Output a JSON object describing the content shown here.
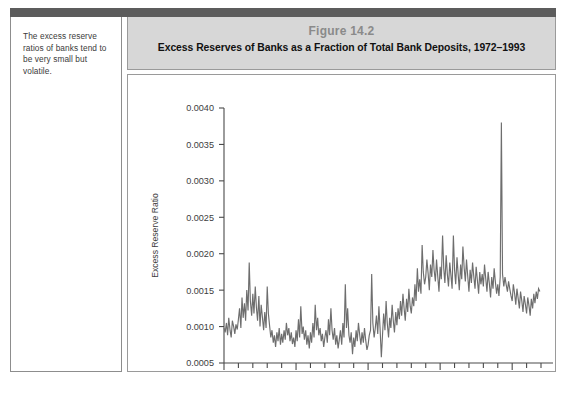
{
  "margin_note": {
    "text": "The excess reserve ratios of banks tend to be very small but volatile."
  },
  "figure": {
    "number_label": "Figure 14.2",
    "title": "Excess Reserves of Banks as a Fraction of Total Bank Deposits, 1972–1993"
  },
  "colors": {
    "caption_background": "#d7d7d7",
    "figure_number_text": "#8a8a8a",
    "title_text": "#111111",
    "top_rule": "#5c5c5c",
    "series_line": "#6e6e6e",
    "axis": "#4a4a4a",
    "panel_border": "#9a9a9a"
  },
  "chart_data": {
    "type": "line",
    "title": "Excess Reserves of Banks as a Fraction of Total Bank Deposits, 1972–1993",
    "xlabel": "",
    "ylabel": "Excess Reserve Ratio",
    "xlim": [
      1972.0,
      1994.0
    ],
    "ylim": [
      0.0005,
      0.004
    ],
    "grid": false,
    "legend": null,
    "ytick_labels": [
      "0.0005",
      "0.0010",
      "0.0015",
      "0.0020",
      "0.0025",
      "0.0030",
      "0.0035",
      "0.0040"
    ],
    "ytick_values": [
      0.0005,
      0.001,
      0.0015,
      0.002,
      0.0025,
      0.003,
      0.0035,
      0.004
    ],
    "xtick_labels": [
      "'72",
      "'77",
      "'82",
      "'87",
      "'92"
    ],
    "xtick_values": [
      1972,
      1977,
      1982,
      1987,
      1992
    ],
    "xtick_minor_step": 1,
    "series": [
      {
        "name": "Excess Reserve Ratio",
        "x": [
          1972.0,
          1972.08,
          1972.17,
          1972.25,
          1972.33,
          1972.42,
          1972.5,
          1972.58,
          1972.67,
          1972.75,
          1972.83,
          1972.92,
          1973.0,
          1973.08,
          1973.17,
          1973.25,
          1973.33,
          1973.42,
          1973.5,
          1973.58,
          1973.67,
          1973.75,
          1973.83,
          1973.92,
          1974.0,
          1974.08,
          1974.17,
          1974.25,
          1974.33,
          1974.42,
          1974.5,
          1974.58,
          1974.67,
          1974.75,
          1974.83,
          1974.92,
          1975.0,
          1975.08,
          1975.17,
          1975.25,
          1975.33,
          1975.42,
          1975.5,
          1975.58,
          1975.67,
          1975.75,
          1975.83,
          1975.92,
          1976.0,
          1976.08,
          1976.17,
          1976.25,
          1976.33,
          1976.42,
          1976.5,
          1976.58,
          1976.67,
          1976.75,
          1976.83,
          1976.92,
          1977.0,
          1977.08,
          1977.17,
          1977.25,
          1977.33,
          1977.42,
          1977.5,
          1977.58,
          1977.67,
          1977.75,
          1977.83,
          1977.92,
          1978.0,
          1978.08,
          1978.17,
          1978.25,
          1978.33,
          1978.42,
          1978.5,
          1978.58,
          1978.67,
          1978.75,
          1978.83,
          1978.92,
          1979.0,
          1979.08,
          1979.17,
          1979.25,
          1979.33,
          1979.42,
          1979.5,
          1979.58,
          1979.67,
          1979.75,
          1979.83,
          1979.92,
          1980.0,
          1980.08,
          1980.17,
          1980.25,
          1980.33,
          1980.42,
          1980.5,
          1980.58,
          1980.67,
          1980.75,
          1980.83,
          1980.92,
          1981.0,
          1981.08,
          1981.17,
          1981.25,
          1981.33,
          1981.42,
          1981.5,
          1981.58,
          1981.67,
          1981.75,
          1981.83,
          1981.92,
          1982.0,
          1982.08,
          1982.17,
          1982.25,
          1982.33,
          1982.42,
          1982.5,
          1982.58,
          1982.67,
          1982.75,
          1982.83,
          1982.92,
          1983.0,
          1983.08,
          1983.17,
          1983.25,
          1983.33,
          1983.42,
          1983.5,
          1983.58,
          1983.67,
          1983.75,
          1983.83,
          1983.92,
          1984.0,
          1984.08,
          1984.17,
          1984.25,
          1984.33,
          1984.42,
          1984.5,
          1984.58,
          1984.67,
          1984.75,
          1984.83,
          1984.92,
          1985.0,
          1985.08,
          1985.17,
          1985.25,
          1985.33,
          1985.42,
          1985.5,
          1985.58,
          1985.67,
          1985.75,
          1985.83,
          1985.92,
          1986.0,
          1986.08,
          1986.17,
          1986.25,
          1986.33,
          1986.42,
          1986.5,
          1986.58,
          1986.67,
          1986.75,
          1986.83,
          1986.92,
          1987.0,
          1987.08,
          1987.17,
          1987.25,
          1987.33,
          1987.42,
          1987.5,
          1987.58,
          1987.67,
          1987.75,
          1987.83,
          1987.92,
          1988.0,
          1988.08,
          1988.17,
          1988.25,
          1988.33,
          1988.42,
          1988.5,
          1988.58,
          1988.67,
          1988.75,
          1988.83,
          1988.92,
          1989.0,
          1989.08,
          1989.17,
          1989.25,
          1989.33,
          1989.42,
          1989.5,
          1989.58,
          1989.67,
          1989.75,
          1989.83,
          1989.92,
          1990.0,
          1990.08,
          1990.17,
          1990.25,
          1990.33,
          1990.42,
          1990.5,
          1990.58,
          1990.67,
          1990.75,
          1990.83,
          1990.92,
          1991.0,
          1991.08,
          1991.17,
          1991.25,
          1991.33,
          1991.42,
          1991.5,
          1991.58,
          1991.67,
          1991.75,
          1991.83,
          1991.92,
          1992.0,
          1992.08,
          1992.17,
          1992.25,
          1992.33,
          1992.42,
          1992.5,
          1992.58,
          1992.67,
          1992.75,
          1992.83,
          1992.92,
          1993.0,
          1993.08,
          1993.17,
          1993.25,
          1993.33,
          1993.42,
          1993.5,
          1993.58,
          1993.67,
          1993.75,
          1993.83,
          1993.92
        ],
        "y": [
          0.00098,
          0.00092,
          0.00105,
          0.00088,
          0.00112,
          0.00095,
          0.00085,
          0.00108,
          0.001,
          0.0009,
          0.00103,
          0.00096,
          0.0011,
          0.00125,
          0.00098,
          0.0014,
          0.00112,
          0.00132,
          0.00108,
          0.0015,
          0.00122,
          0.00188,
          0.00135,
          0.00115,
          0.00145,
          0.00118,
          0.00155,
          0.00126,
          0.00108,
          0.00142,
          0.001,
          0.0013,
          0.00112,
          0.00095,
          0.0012,
          0.00098,
          0.00155,
          0.00118,
          0.001,
          0.00085,
          0.00095,
          0.00078,
          0.00088,
          0.00072,
          0.00092,
          0.0008,
          0.00098,
          0.00075,
          0.0009,
          0.00078,
          0.00095,
          0.00082,
          0.00105,
          0.00088,
          0.00098,
          0.0008,
          0.00092,
          0.00076,
          0.00085,
          0.00072,
          0.00095,
          0.0008,
          0.0011,
          0.00085,
          0.00128,
          0.0009,
          0.001,
          0.00082,
          0.00095,
          0.00075,
          0.00088,
          0.0007,
          0.00092,
          0.00078,
          0.00105,
          0.00085,
          0.0013,
          0.00095,
          0.00112,
          0.00088,
          0.00098,
          0.0008,
          0.0009,
          0.00072,
          0.00085,
          0.00095,
          0.00078,
          0.0011,
          0.00088,
          0.00125,
          0.00095,
          0.00082,
          0.00098,
          0.00075,
          0.00088,
          0.0007,
          0.00082,
          0.00095,
          0.00075,
          0.00105,
          0.00085,
          0.00158,
          0.00098,
          0.00125,
          0.00088,
          0.00078,
          0.00092,
          0.00062,
          0.00085,
          0.00072,
          0.00095,
          0.0008,
          0.00105,
          0.00088,
          0.00075,
          0.00092,
          0.00078,
          0.00098,
          0.00082,
          0.00068,
          0.00075,
          0.00088,
          0.00095,
          0.00172,
          0.00105,
          0.00085,
          0.00098,
          0.00115,
          0.0009,
          0.00128,
          0.00098,
          0.00058,
          0.00088,
          0.00118,
          0.00095,
          0.00135,
          0.00105,
          0.00085,
          0.00112,
          0.00098,
          0.0013,
          0.00108,
          0.00092,
          0.0012,
          0.00102,
          0.00125,
          0.0011,
          0.00135,
          0.00115,
          0.00145,
          0.00125,
          0.00108,
          0.00138,
          0.0012,
          0.00152,
          0.00128,
          0.00118,
          0.0014,
          0.00128,
          0.00158,
          0.00135,
          0.0018,
          0.00148,
          0.00165,
          0.00145,
          0.00212,
          0.00175,
          0.00158,
          0.00168,
          0.00192,
          0.00172,
          0.0015,
          0.00185,
          0.00168,
          0.00205,
          0.00178,
          0.00162,
          0.00192,
          0.0017,
          0.00148,
          0.00182,
          0.00165,
          0.00225,
          0.0018,
          0.0016,
          0.00198,
          0.00172,
          0.00155,
          0.00188,
          0.0017,
          0.00152,
          0.00225,
          0.00178,
          0.00158,
          0.00195,
          0.00172,
          0.0015,
          0.00185,
          0.00165,
          0.0021,
          0.0018,
          0.00162,
          0.00192,
          0.00168,
          0.00148,
          0.00178,
          0.0016,
          0.00188,
          0.0017,
          0.00152,
          0.00182,
          0.00165,
          0.00145,
          0.00175,
          0.00158,
          0.00172,
          0.00155,
          0.00185,
          0.00165,
          0.00148,
          0.00175,
          0.00158,
          0.0014,
          0.00168,
          0.00152,
          0.0018,
          0.00162,
          0.00145,
          0.00158,
          0.00142,
          0.00168,
          0.0038,
          0.00172,
          0.00155,
          0.00168,
          0.00158,
          0.00148,
          0.00162,
          0.00152,
          0.00142,
          0.00135,
          0.00158,
          0.00145,
          0.0013,
          0.00152,
          0.00138,
          0.00125,
          0.00148,
          0.00135,
          0.0012,
          0.00142,
          0.0013,
          0.00118,
          0.0014,
          0.00128,
          0.00115,
          0.00138,
          0.00125,
          0.00145,
          0.00132,
          0.00148,
          0.00138,
          0.00152,
          0.00148
        ]
      }
    ],
    "annotations": [
      {
        "label": "spike",
        "x": 1990.25,
        "y": 0.0038
      }
    ]
  }
}
